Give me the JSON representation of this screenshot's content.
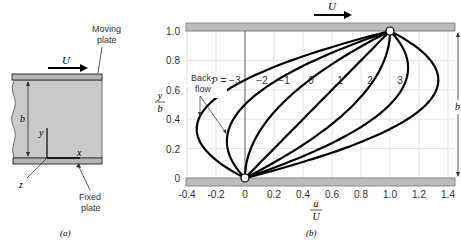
{
  "panel_a": {
    "caption": "(a)",
    "velocity_label": "U",
    "moving_plate_label": [
      "Moving",
      "plate"
    ],
    "fixed_plate_label": [
      "Fixed",
      "plate"
    ],
    "gap_label": "b",
    "axis_x": "x",
    "axis_y": "y",
    "axis_z": "z"
  },
  "panel_b": {
    "caption": "(b)",
    "velocity_label": "U",
    "gap_label": "b",
    "backflow_label": [
      "Back-",
      "flow"
    ],
    "xlabel_num": "u",
    "xlabel_den": "U",
    "ylabel_num": "y",
    "ylabel_den": "b",
    "p_prefix": "P = ",
    "x_ticks": [
      "-0.4",
      "-0.2",
      "0",
      "0.2",
      "0.4",
      "0.6",
      "0.8",
      "1.0",
      "1.2",
      "1.4"
    ],
    "y_ticks": [
      "0",
      "0.2",
      "0.4",
      "0.6",
      "0.8",
      "1.0"
    ],
    "curve_labels": [
      "−3",
      "−2",
      "−1",
      "0",
      "1",
      "2",
      "3"
    ]
  },
  "chart_data": {
    "type": "line",
    "xlabel": "u/U",
    "ylabel": "y/b",
    "xlim": [
      -0.4,
      1.45
    ],
    "ylim": [
      0,
      1.0
    ],
    "grid": true,
    "formula": "u/U = y/b + P (y/b)(1 - y/b)",
    "y": [
      0,
      0.1,
      0.2,
      0.3,
      0.4,
      0.5,
      0.6,
      0.7,
      0.8,
      0.9,
      1.0
    ],
    "series": [
      {
        "name": "P = -3",
        "values": [
          0,
          -0.17,
          -0.28,
          -0.33,
          -0.32,
          -0.25,
          -0.12,
          0.07,
          0.32,
          0.63,
          1.0
        ]
      },
      {
        "name": "P = -2",
        "values": [
          0,
          -0.08,
          -0.12,
          -0.12,
          -0.08,
          0.0,
          0.12,
          0.28,
          0.48,
          0.72,
          1.0
        ]
      },
      {
        "name": "P = -1",
        "values": [
          0,
          0.01,
          0.04,
          0.09,
          0.16,
          0.25,
          0.36,
          0.49,
          0.64,
          0.81,
          1.0
        ]
      },
      {
        "name": "P = 0",
        "values": [
          0,
          0.1,
          0.2,
          0.3,
          0.4,
          0.5,
          0.6,
          0.7,
          0.8,
          0.9,
          1.0
        ]
      },
      {
        "name": "P = 1",
        "values": [
          0,
          0.19,
          0.36,
          0.51,
          0.64,
          0.75,
          0.84,
          0.91,
          0.96,
          0.99,
          1.0
        ]
      },
      {
        "name": "P = 2",
        "values": [
          0,
          0.28,
          0.52,
          0.72,
          0.88,
          1.0,
          1.08,
          1.12,
          1.12,
          1.08,
          1.0
        ]
      },
      {
        "name": "P = 3",
        "values": [
          0,
          0.37,
          0.68,
          0.93,
          1.12,
          1.25,
          1.32,
          1.33,
          1.28,
          1.17,
          1.0
        ]
      }
    ],
    "annotations": [
      "Back-flow",
      "U (moving plate velocity)",
      "b (gap)"
    ]
  }
}
